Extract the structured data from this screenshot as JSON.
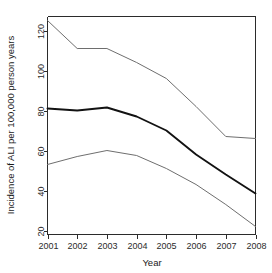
{
  "chart_data": {
    "type": "line",
    "title": "",
    "xlabel": "Year",
    "ylabel": "Incidence of ALI per 100,000 person years",
    "categories": [
      "2001",
      "2002",
      "2003",
      "2004",
      "2005",
      "2006",
      "2007",
      "2008"
    ],
    "x": [
      2001,
      2002,
      2003,
      2004,
      2005,
      2006,
      2007,
      2008
    ],
    "xlim": [
      2001,
      2008
    ],
    "ylim": [
      18,
      127
    ],
    "xticks": [
      "2001",
      "2002",
      "2003",
      "2004",
      "2005",
      "2006",
      "2007",
      "2008"
    ],
    "yticks": [
      "20",
      "40",
      "60",
      "80",
      "100",
      "120"
    ],
    "ytick_values": [
      20,
      40,
      60,
      80,
      100,
      120
    ],
    "grid": false,
    "legend": "none",
    "series": [
      {
        "name": "Upper confidence limit",
        "style": "thin-grey",
        "color": "#6e6e6e",
        "values": [
          125,
          111,
          111,
          104,
          96,
          82,
          67,
          66
        ]
      },
      {
        "name": "Incidence estimate",
        "style": "bold-black",
        "color": "#121212",
        "values": [
          81,
          80,
          81.5,
          77,
          70,
          58,
          48,
          38.5
        ]
      },
      {
        "name": "Lower confidence limit",
        "style": "thin-grey",
        "color": "#6e6e6e",
        "values": [
          53,
          57,
          60,
          57.5,
          51,
          43,
          33,
          22
        ]
      }
    ]
  }
}
